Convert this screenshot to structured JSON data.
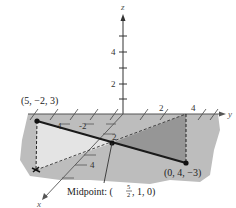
{
  "figure": {
    "axes": {
      "x_label": "x",
      "y_label": "y",
      "z_label": "z",
      "z_ticks": [
        "2",
        "4"
      ],
      "y_ticks": [
        "-4",
        "-2",
        "2",
        "4"
      ],
      "x_ticks": [
        "2",
        "4"
      ]
    },
    "points": {
      "p1": "(5, −2, 3)",
      "p2": "(0, 4, −3)",
      "midpoint_prefix": "Midpoint: (",
      "midpoint_frac_num": "5",
      "midpoint_frac_den": "2",
      "midpoint_suffix": ", 1, 0)"
    },
    "colors": {
      "plane": "#bdbdbd",
      "triangle_light": "#e2e2e2",
      "triangle_dark": "#9a9a9a",
      "segment": "#1a1a1a"
    }
  }
}
